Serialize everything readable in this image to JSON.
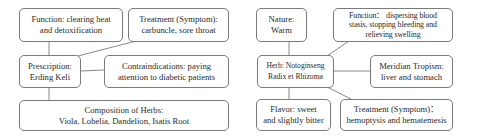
{
  "diagrams": [
    {
      "center": {
        "lines": [
          "Prescription:",
          "Erding Keli"
        ]
      },
      "nodes": {
        "function": {
          "lines": [
            "Function: clearing heat",
            "and detoxification"
          ]
        },
        "treatment": {
          "lines": [
            "Treatment (Symptom):",
            "carbuncle, sore throat"
          ]
        },
        "contraindications": {
          "lines": [
            "Contraindications: paying",
            "attention to diabetic patients"
          ]
        },
        "composition": {
          "lines": [
            "Composition of Herbs:",
            "Viola, Lobelia, Dandelion, Isatis Root"
          ]
        }
      }
    },
    {
      "center": {
        "lines": [
          "Herb: Notoginseng",
          "Radix et Rhizoma"
        ]
      },
      "nodes": {
        "nature": {
          "lines": [
            "Nature:",
            "Warm"
          ]
        },
        "function": {
          "lines": [
            "Function： dispersing blood",
            "stasis, stopping bleeding and",
            "relieving swelling"
          ]
        },
        "meridian": {
          "lines": [
            "Meridian Tropism:",
            "liver and stomach"
          ]
        },
        "flavor": {
          "lines": [
            "Flavor: sweet",
            "and slightly bitter"
          ]
        },
        "treatment": {
          "lines": [
            "Treatment (Symptom)：",
            "hemoptysis and hematemesis"
          ]
        }
      }
    }
  ],
  "colors": {
    "border": "#7a7a7a",
    "line": "#7a7a7a",
    "text": "#2a2a2a",
    "background": "#ffffff"
  }
}
